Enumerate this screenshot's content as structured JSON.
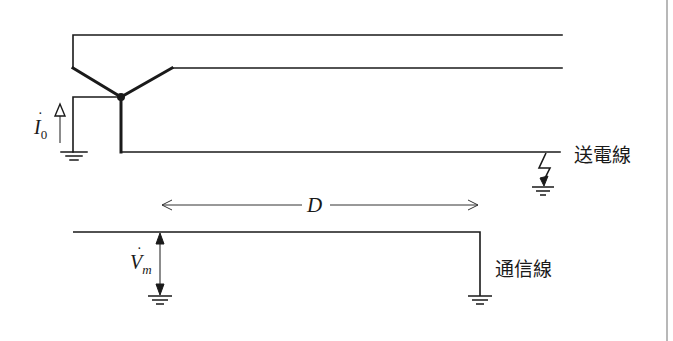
{
  "labels": {
    "power_line": "送電線",
    "comm_line": "通信線",
    "distance": "D",
    "current": "I",
    "current_sub": "0",
    "voltage": "V",
    "voltage_sub": "m"
  },
  "colors": {
    "line": "#1a1a1a",
    "background": "#ffffff",
    "frame": "#b8b8b8"
  }
}
